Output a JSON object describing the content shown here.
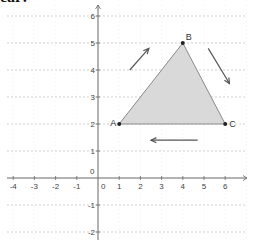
{
  "header": {
    "clipped_text": "ear:"
  },
  "chart_data": {
    "type": "scatter",
    "title": "",
    "xlabel": "",
    "ylabel": "",
    "xlim": [
      -4.5,
      7
    ],
    "ylim": [
      -2.5,
      6.5
    ],
    "grid": true,
    "x_ticks": [
      "-4",
      "-3",
      "-2",
      "-1",
      "0",
      "1",
      "2",
      "3",
      "4",
      "5",
      "6"
    ],
    "y_ticks": [
      "-2",
      "-1",
      "0",
      "1",
      "2",
      "3",
      "4",
      "5",
      "6"
    ],
    "points": [
      {
        "label": "A",
        "x": 1,
        "y": 2
      },
      {
        "label": "B",
        "x": 4,
        "y": 5
      },
      {
        "label": "C",
        "x": 6,
        "y": 2
      }
    ],
    "polygon": {
      "vertices": [
        "A",
        "B",
        "C"
      ],
      "fill": "#d9d9d9",
      "stroke": "#8a8a8a"
    },
    "annotations": [
      {
        "type": "arrow",
        "direction": "up-right",
        "from": [
          1.5,
          4
        ],
        "to": [
          2.4,
          4.8
        ],
        "meaning": "A to B"
      },
      {
        "type": "arrow",
        "direction": "down-right",
        "from": [
          5.2,
          4.8
        ],
        "to": [
          6.2,
          3.5
        ],
        "meaning": "B to C"
      },
      {
        "type": "arrow",
        "direction": "left",
        "from": [
          4.7,
          1.4
        ],
        "to": [
          2.5,
          1.4
        ],
        "meaning": "C to A"
      }
    ]
  },
  "colors": {
    "axis": "#666666",
    "grid": "#bbbbbb",
    "fill": "#d9d9d9",
    "edge": "#8a8a8a",
    "arrow": "#555555"
  }
}
